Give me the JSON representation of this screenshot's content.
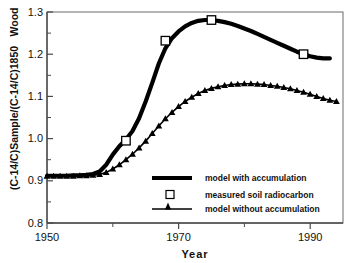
{
  "chart_data": {
    "type": "line",
    "title": "",
    "xlabel": "Year",
    "ylabel": "(C-14/C)Sample/(C-14/C)1850   Wood",
    "ylabel_main": "(C-14/C)Sample/(C-14/C)1850",
    "ylabel_top": "Wood",
    "xlim": [
      1950,
      1995
    ],
    "ylim": [
      0.8,
      1.3
    ],
    "xticks": [
      1950,
      1970,
      1990
    ],
    "xticks_minor": [
      1960,
      1980
    ],
    "xtick_labels": [
      "1950",
      "1970",
      "1990"
    ],
    "yticks": [
      0.8,
      0.9,
      1.0,
      1.1,
      1.2,
      1.3
    ],
    "ytick_labels": [
      "0.8",
      "0.9",
      "1.0",
      "1.1",
      "1.2",
      "1.3"
    ],
    "grid": false,
    "legend_position": "lower-center-inside",
    "series": [
      {
        "name": "model with accumulation",
        "style": "thick-line",
        "color": "#000000",
        "x": [
          1950,
          1951,
          1952,
          1953,
          1954,
          1955,
          1956,
          1957,
          1958,
          1959,
          1960,
          1961,
          1962,
          1963,
          1964,
          1965,
          1966,
          1967,
          1968,
          1969,
          1970,
          1971,
          1972,
          1973,
          1974,
          1975,
          1976,
          1977,
          1978,
          1979,
          1980,
          1981,
          1982,
          1983,
          1984,
          1985,
          1986,
          1987,
          1988,
          1989,
          1990,
          1991,
          1992,
          1993
        ],
        "values": [
          0.912,
          0.912,
          0.912,
          0.912,
          0.913,
          0.913,
          0.914,
          0.916,
          0.922,
          0.938,
          0.962,
          0.982,
          0.998,
          1.018,
          1.048,
          1.088,
          1.132,
          1.178,
          1.214,
          1.238,
          1.254,
          1.266,
          1.274,
          1.279,
          1.281,
          1.281,
          1.279,
          1.276,
          1.272,
          1.267,
          1.261,
          1.255,
          1.248,
          1.241,
          1.234,
          1.227,
          1.22,
          1.213,
          1.206,
          1.2,
          1.195,
          1.192,
          1.19,
          1.19
        ]
      },
      {
        "name": "model without accumulation",
        "style": "triangle-markers-line",
        "color": "#000000",
        "x": [
          1950,
          1951,
          1952,
          1953,
          1954,
          1955,
          1956,
          1957,
          1958,
          1959,
          1960,
          1961,
          1962,
          1963,
          1964,
          1965,
          1966,
          1967,
          1968,
          1969,
          1970,
          1971,
          1972,
          1973,
          1974,
          1975,
          1976,
          1977,
          1978,
          1979,
          1980,
          1981,
          1982,
          1983,
          1984,
          1985,
          1986,
          1987,
          1988,
          1989,
          1990,
          1991,
          1992,
          1993,
          1994
        ],
        "values": [
          0.911,
          0.911,
          0.911,
          0.911,
          0.911,
          0.912,
          0.912,
          0.913,
          0.915,
          0.92,
          0.928,
          0.938,
          0.95,
          0.963,
          0.978,
          0.994,
          1.012,
          1.03,
          1.047,
          1.062,
          1.076,
          1.088,
          1.098,
          1.107,
          1.114,
          1.119,
          1.123,
          1.126,
          1.128,
          1.129,
          1.13,
          1.13,
          1.129,
          1.128,
          1.126,
          1.124,
          1.121,
          1.118,
          1.114,
          1.11,
          1.105,
          1.1,
          1.095,
          1.091,
          1.088
        ]
      },
      {
        "name": "measured soil radiocarbon",
        "style": "open-square-markers",
        "color": "#000000",
        "x": [
          1962,
          1968,
          1975,
          1989
        ],
        "values": [
          0.995,
          1.232,
          1.281,
          1.2
        ]
      }
    ],
    "legend": [
      {
        "label": "model with accumulation",
        "marker": "thick-line"
      },
      {
        "label": "measured soil radiocarbon",
        "marker": "open-square"
      },
      {
        "label": "model without accumulation",
        "marker": "triangle-on-line"
      }
    ]
  }
}
